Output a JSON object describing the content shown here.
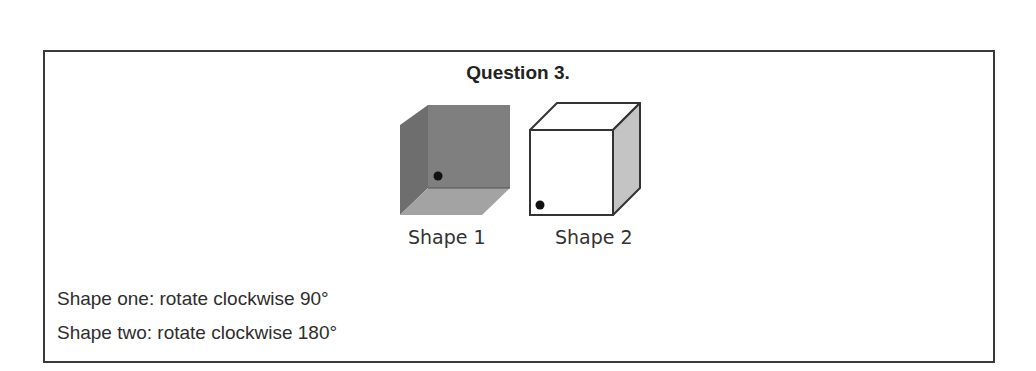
{
  "question": {
    "title": "Question 3.",
    "shapes": [
      {
        "label": "Shape 1",
        "face_color": "#7f7f7f",
        "side_color": "#6e6e6e",
        "bottom_color": "#a3a3a3"
      },
      {
        "label": "Shape 2",
        "face_color": "#ffffff",
        "side_color": "#c4c4c4"
      }
    ],
    "instructions": [
      "Shape one: rotate clockwise 90°",
      "Shape two: rotate clockwise 180°"
    ]
  }
}
